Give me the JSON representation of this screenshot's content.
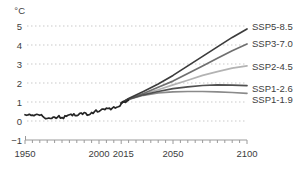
{
  "chart_data": {
    "type": "line",
    "title": "",
    "ylabel": "°C",
    "legend_position": "right-of-lines",
    "grid": "horizontal-dotted",
    "x_axis": {
      "min": 1950,
      "max": 2100,
      "labeled_ticks": [
        1950,
        2000,
        2015,
        2050,
        2100
      ],
      "minor_tick_step": 5
    },
    "y_axis": {
      "min": -1,
      "max": 5,
      "ticks": [
        5,
        4,
        3,
        2,
        1,
        0,
        -1
      ],
      "gridlines": [
        5,
        4,
        3,
        2,
        1,
        0
      ]
    },
    "series": [
      {
        "id": "ssp2-4.5",
        "label": "SSP2-4.5",
        "color": "#b3b3b3",
        "x": [
          2015,
          2020,
          2030,
          2040,
          2050,
          2060,
          2070,
          2080,
          2090,
          2100
        ],
        "y": [
          0.95,
          1.15,
          1.42,
          1.65,
          1.9,
          2.15,
          2.4,
          2.6,
          2.78,
          2.9
        ]
      },
      {
        "id": "ssp1-1.9",
        "label": "SSP1-1.9",
        "color": "#8a8a8a",
        "x": [
          2015,
          2020,
          2030,
          2040,
          2050,
          2060,
          2070,
          2080,
          2090,
          2100
        ],
        "y": [
          0.95,
          1.13,
          1.35,
          1.48,
          1.53,
          1.55,
          1.55,
          1.53,
          1.5,
          1.46
        ]
      },
      {
        "id": "ssp3-7.0",
        "label": "SSP3-7.0",
        "color": "#6f6f6f",
        "x": [
          2015,
          2020,
          2030,
          2040,
          2050,
          2060,
          2070,
          2080,
          2090,
          2100
        ],
        "y": [
          0.95,
          1.16,
          1.45,
          1.78,
          2.1,
          2.5,
          2.9,
          3.3,
          3.7,
          4.05
        ]
      },
      {
        "id": "ssp1-2.6",
        "label": "SSP1-2.6",
        "color": "#505050",
        "x": [
          2015,
          2020,
          2030,
          2040,
          2050,
          2060,
          2070,
          2080,
          2090,
          2100
        ],
        "y": [
          0.95,
          1.14,
          1.38,
          1.55,
          1.7,
          1.8,
          1.87,
          1.9,
          1.89,
          1.86
        ]
      },
      {
        "id": "ssp5-8.5",
        "label": "SSP5-8.5",
        "color": "#3c3c3c",
        "x": [
          2015,
          2020,
          2030,
          2040,
          2050,
          2060,
          2070,
          2080,
          2090,
          2100
        ],
        "y": [
          0.95,
          1.18,
          1.55,
          1.95,
          2.4,
          2.9,
          3.4,
          3.9,
          4.4,
          4.85
        ]
      },
      {
        "id": "historical",
        "label": "",
        "color": "#252525",
        "x": [
          1950,
          1951,
          1952,
          1953,
          1954,
          1955,
          1956,
          1957,
          1958,
          1959,
          1960,
          1961,
          1962,
          1963,
          1964,
          1965,
          1966,
          1967,
          1968,
          1969,
          1970,
          1971,
          1972,
          1973,
          1974,
          1975,
          1976,
          1977,
          1978,
          1979,
          1980,
          1981,
          1982,
          1983,
          1984,
          1985,
          1986,
          1987,
          1988,
          1989,
          1990,
          1991,
          1992,
          1993,
          1994,
          1995,
          1996,
          1997,
          1998,
          1999,
          2000,
          2001,
          2002,
          2003,
          2004,
          2005,
          2006,
          2007,
          2008,
          2009,
          2010,
          2011,
          2012,
          2013,
          2014,
          2015,
          2016,
          2017,
          2018,
          2019,
          2020
        ],
        "y": [
          0.33,
          0.3,
          0.32,
          0.35,
          0.3,
          0.31,
          0.28,
          0.33,
          0.35,
          0.33,
          0.3,
          0.33,
          0.25,
          0.18,
          0.12,
          0.13,
          0.16,
          0.14,
          0.13,
          0.2,
          0.2,
          0.14,
          0.2,
          0.28,
          0.15,
          0.18,
          0.13,
          0.28,
          0.25,
          0.3,
          0.33,
          0.36,
          0.28,
          0.38,
          0.28,
          0.28,
          0.32,
          0.4,
          0.42,
          0.35,
          0.45,
          0.42,
          0.3,
          0.32,
          0.36,
          0.45,
          0.4,
          0.5,
          0.58,
          0.48,
          0.5,
          0.56,
          0.62,
          0.63,
          0.6,
          0.68,
          0.66,
          0.68,
          0.6,
          0.68,
          0.75,
          0.68,
          0.72,
          0.75,
          0.78,
          0.9,
          1.02,
          1.0,
          0.98,
          1.05,
          1.1
        ]
      }
    ]
  },
  "colors": {
    "background": "#ffffff",
    "text": "#3d3d3d",
    "axis": "#9a9a9a",
    "grid": "#c9c9c9"
  }
}
